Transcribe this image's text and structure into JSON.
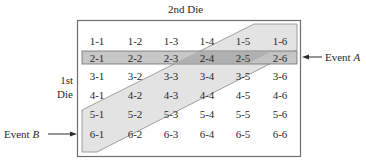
{
  "title": "2nd Die",
  "row_label_line1": "1st",
  "row_label_line2": "Die",
  "event_a": {
    "prefix": "Event ",
    "letter": "A",
    "description": "Row where first die is 2"
  },
  "event_b": {
    "prefix": "Event ",
    "letter": "B",
    "description": "Diagonal band: second die minus first die equals 0 or 1 (shaded)"
  },
  "colors": {
    "border": "#6e6e6e",
    "band_a": "#bdbdbd",
    "band_b": "#e3e3e3",
    "overlap": "#a8a8a8",
    "text": "#2a2a2a"
  },
  "grid": {
    "rows": [
      [
        "1-1",
        "1-2",
        "1-3",
        "1-4",
        "1-5",
        "1-6"
      ],
      [
        "2-1",
        "2-2",
        "2-3",
        "2-4",
        "2-5",
        "2-6"
      ],
      [
        "3-1",
        "3-2",
        "3-3",
        "3-4",
        "3-5",
        "3-6"
      ],
      [
        "4-1",
        "4-2",
        "4-3",
        "4-4",
        "4-5",
        "4-6"
      ],
      [
        "5-1",
        "5-2",
        "5-3",
        "5-4",
        "5-5",
        "5-6"
      ],
      [
        "6-1",
        "6-2",
        "6-3",
        "6-4",
        "6-5",
        "6-6"
      ]
    ]
  }
}
